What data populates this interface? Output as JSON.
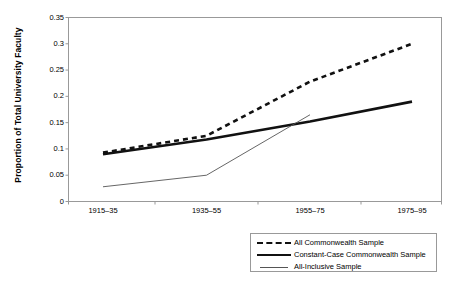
{
  "chart_data": {
    "type": "line",
    "title": "",
    "subtitle": "",
    "xlabel": "",
    "ylabel": "Proportion of Total University Faculty",
    "categories": [
      "1915–35",
      "1935–55",
      "1955–75",
      "1975–95"
    ],
    "ylim": [
      0,
      0.35
    ],
    "yticks": [
      "0",
      "0.05",
      "0.1",
      "0.15",
      "0.2",
      "0.25",
      "0.3",
      "0.35"
    ],
    "ytick_values": [
      0,
      0.05,
      0.1,
      0.15,
      0.2,
      0.25,
      0.3,
      0.35
    ],
    "grid": false,
    "legend_position": "bottom-right",
    "series": [
      {
        "name": "All Commonwealth Sample",
        "style": "dashed",
        "color": "#111111",
        "values": [
          0.093,
          0.125,
          0.228,
          0.3
        ]
      },
      {
        "name": "Constant-Case Commonwealth Sample",
        "style": "solid-thick",
        "color": "#111111",
        "values": [
          0.09,
          0.118,
          0.152,
          0.19
        ]
      },
      {
        "name": "All-Inclusive Sample",
        "style": "solid-thin",
        "color": "#555555",
        "values": [
          0.028,
          0.05,
          0.165,
          null
        ]
      }
    ]
  },
  "legend": {
    "items": [
      {
        "label": "All Commonwealth Sample",
        "style": "dashed"
      },
      {
        "label": "Constant-Case Commonwealth Sample",
        "style": "solid-thick"
      },
      {
        "label": "All-Inclusive Sample",
        "style": "solid-thin"
      }
    ]
  },
  "axes": {
    "y_title": "Proportion of Total University Faculty"
  },
  "colors": {
    "plot_border": "#999999",
    "background": "#ffffff",
    "series_primary": "#111111",
    "series_secondary": "#555555"
  }
}
